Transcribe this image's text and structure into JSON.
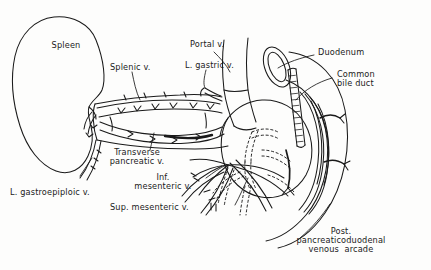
{
  "figure": {
    "type": "anatomical-line-drawing",
    "style": "black ink line drawing on white, hand-lettered labels",
    "line_color": "#1a1a1a",
    "background_color": "#fdfdfc"
  },
  "labels": {
    "spleen": "Spleen",
    "splenic_vein": "Splenic v.",
    "l_gastric_vein": "L. gastric v.",
    "portal_vein": "Portal v.",
    "duodenum": "Duodenum",
    "common_bile_duct_line1": "Common",
    "common_bile_duct_line2": "bile duct",
    "transverse_pancreatic_line1": "Transverse",
    "transverse_pancreatic_line2": "pancreatic v.",
    "inf_mesenteric_line1": "Inf.",
    "inf_mesenteric_line2": "mesenteric v.",
    "sup_mesenteric": "Sup. mesenteric v.",
    "l_gastroepiploic": "L. gastroepiploic v.",
    "post_arcade_line1": "Post.",
    "post_arcade_line2": "pancreaticoduodenal",
    "post_arcade_line3": "venous  arcade"
  },
  "structures": [
    {
      "name": "spleen",
      "kind": "organ"
    },
    {
      "name": "pancreas-body-tail",
      "kind": "organ"
    },
    {
      "name": "pancreas-head",
      "kind": "organ"
    },
    {
      "name": "duodenum",
      "kind": "organ"
    },
    {
      "name": "splenic-vein",
      "kind": "vessel"
    },
    {
      "name": "portal-vein",
      "kind": "vessel"
    },
    {
      "name": "left-gastric-vein",
      "kind": "vessel"
    },
    {
      "name": "transverse-pancreatic-vein",
      "kind": "vessel"
    },
    {
      "name": "inferior-mesenteric-vein",
      "kind": "vessel"
    },
    {
      "name": "superior-mesenteric-vein",
      "kind": "vessel"
    },
    {
      "name": "left-gastroepiploic-vein",
      "kind": "vessel"
    },
    {
      "name": "posterior-pancreaticoduodenal-venous-arcade",
      "kind": "vessel"
    },
    {
      "name": "common-bile-duct",
      "kind": "duct"
    }
  ]
}
